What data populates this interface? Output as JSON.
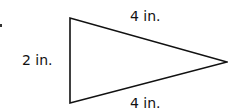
{
  "figure": {
    "shape": "isosceles triangle",
    "stroke_color": "#111111",
    "vertices": {
      "top_left": [
        70,
        18
      ],
      "bottom_left": [
        70,
        103
      ],
      "right": [
        227,
        62
      ]
    },
    "labels": {
      "left_side": "2 in.",
      "top_side": "4 in.",
      "bottom_side": "4 in."
    }
  }
}
